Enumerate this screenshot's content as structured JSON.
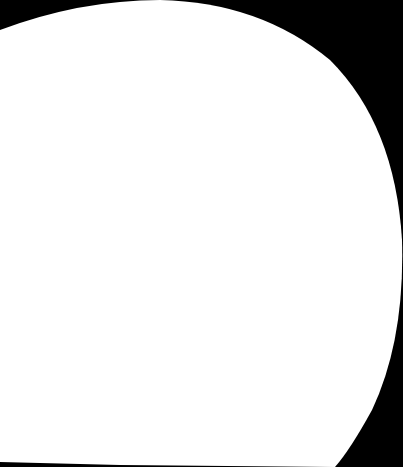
{
  "scene": {
    "background_color": "#000000",
    "shape_color": "#ffffff",
    "description": ""
  }
}
